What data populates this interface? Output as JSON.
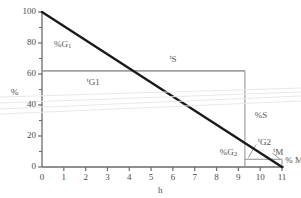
{
  "chart_data": {
    "type": "line",
    "title": "",
    "xlabel": "h",
    "ylabel": "%",
    "xlim": [
      0,
      11
    ],
    "ylim": [
      0,
      100
    ],
    "grid": false,
    "legend": "none",
    "xticks": [
      "0",
      "1",
      "2",
      "3",
      "4",
      "5",
      "6",
      "7",
      "8",
      "9",
      "10",
      "11"
    ],
    "yticks": [
      "0",
      "20",
      "40",
      "60",
      "80",
      "100"
    ],
    "y_minor_ticks": [
      10,
      30,
      50,
      70,
      90
    ],
    "series": [
      {
        "name": "main-decline",
        "type": "line",
        "x": [
          0,
          11
        ],
        "values": [
          100,
          0
        ],
        "color": "#1a1a1a",
        "width": 2.4
      }
    ],
    "reference_lines": [
      {
        "name": "tG1-horizontal",
        "orientation": "horizontal",
        "y": 62,
        "x_from": 0,
        "x_to": 9.3,
        "color": "#8f8f8f"
      },
      {
        "name": "tS-horizontal",
        "orientation": "horizontal",
        "y": 62,
        "x_from": 0,
        "x_to": 9.3,
        "color": "#8f8f8f"
      },
      {
        "name": "tS-vertical",
        "orientation": "vertical",
        "x": 9.3,
        "y_from": 0,
        "y_to": 62,
        "color": "#8f8f8f"
      },
      {
        "name": "tM-box-top",
        "orientation": "horizontal",
        "y": 5,
        "x_from": 9.3,
        "x_to": 11,
        "color": "#8f8f8f"
      },
      {
        "name": "tM-box-right",
        "orientation": "vertical",
        "x": 11,
        "y_from": 0,
        "y_to": 5,
        "color": "#8f8f8f"
      }
    ],
    "annotations": [
      {
        "name": "pct-G1",
        "text_html": "%G<sub>1</sub>",
        "x": 0.55,
        "y": 79
      },
      {
        "name": "t-G1",
        "text_html": "<sup>t</sup>G1",
        "x": 2.05,
        "y": 55
      },
      {
        "name": "t-S",
        "text_html": "<sup>t</sup>S",
        "x": 5.85,
        "y": 70
      },
      {
        "name": "pct-S",
        "text_html": "%S",
        "x": 9.75,
        "y": 33
      },
      {
        "name": "pct-G2",
        "text_html": "%G<sub>2</sub>",
        "x": 8.15,
        "y": 9
      },
      {
        "name": "t-G2",
        "text_html": "<sup>t</sup>G2",
        "x": 9.9,
        "y": 16
      },
      {
        "name": "t-M",
        "text_html": "<sup>t</sup>M",
        "x": 10.6,
        "y": 10
      },
      {
        "name": "pct-M",
        "text_html": "% M",
        "x": 11.15,
        "y": 4
      }
    ],
    "leader_lines": [
      {
        "name": "tG2-leader",
        "x1": 9.82,
        "y1": 14.5,
        "x2": 9.45,
        "y2": 6.0
      },
      {
        "name": "tM-leader",
        "x1": 10.56,
        "y1": 9.0,
        "x2": 10.9,
        "y2": 5.2
      }
    ]
  }
}
